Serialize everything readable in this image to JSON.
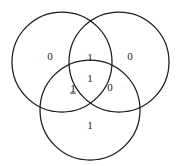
{
  "figure": {
    "kind": "venn-diagram",
    "width": 182,
    "height": 166,
    "background_color": "#ffffff",
    "stroke_color": "#1a1a1a",
    "text_color": "#1a1a1a"
  },
  "circles": [
    {
      "id": "top-left",
      "cx": 62,
      "cy": 62,
      "r": 50
    },
    {
      "id": "top-right",
      "cx": 119,
      "cy": 62,
      "r": 50
    },
    {
      "id": "bottom",
      "cx": 90,
      "cy": 110,
      "r": 50
    }
  ],
  "regions": [
    {
      "id": "left-only",
      "value": "0",
      "x": 50,
      "y": 56,
      "underlined": false
    },
    {
      "id": "top-lens",
      "value": "1",
      "x": 90,
      "y": 57,
      "underlined": false
    },
    {
      "id": "right-only",
      "value": "0",
      "x": 130,
      "y": 56,
      "underlined": false
    },
    {
      "id": "center-all-three",
      "value": "1",
      "x": 90,
      "y": 78,
      "underlined": false
    },
    {
      "id": "left-bottom-lens",
      "value": "1",
      "x": 73,
      "y": 88,
      "underlined": true
    },
    {
      "id": "right-bottom-lens",
      "value": "0",
      "x": 110,
      "y": 87,
      "underlined": false
    },
    {
      "id": "bottom-only",
      "value": "1",
      "x": 90,
      "y": 125,
      "underlined": false
    }
  ]
}
